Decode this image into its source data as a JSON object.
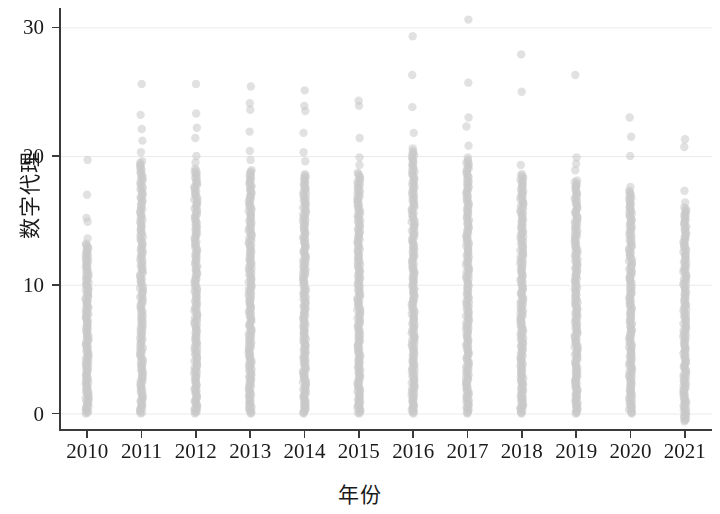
{
  "chart_data": {
    "type": "scatter",
    "title": "",
    "xlabel": "年份",
    "ylabel": "数字代理",
    "grid": true,
    "grid_axis": "y",
    "legend": "none",
    "point_color": "#c9c9c9",
    "point_opacity": 0.55,
    "point_radius": 4.2,
    "axis_color": "#3a3a3a",
    "background": "#ffffff",
    "xlim": [
      2009.5,
      2021.5
    ],
    "ylim": [
      -1.2,
      31.5
    ],
    "ytick_values": [
      0,
      10,
      20,
      30
    ],
    "ytick_labels": [
      "0",
      "10",
      "20",
      "30"
    ],
    "categories": [
      2010,
      2011,
      2012,
      2013,
      2014,
      2015,
      2016,
      2017,
      2018,
      2019,
      2020,
      2021
    ],
    "xtick_labels": [
      "2010",
      "2011",
      "2012",
      "2013",
      "2014",
      "2015",
      "2016",
      "2017",
      "2018",
      "2019",
      "2020",
      "2021"
    ],
    "columns": [
      {
        "year": 2010,
        "max": 19.7,
        "dense_top": 13.2,
        "dense_bottom": 0.0,
        "dense_count": 150,
        "outliers": [
          19.7,
          17.0,
          15.2,
          14.9,
          13.6
        ]
      },
      {
        "year": 2011,
        "max": 25.6,
        "dense_top": 19.6,
        "dense_bottom": 0.0,
        "dense_count": 175,
        "outliers": [
          25.6,
          23.2,
          22.1,
          21.2,
          20.3
        ]
      },
      {
        "year": 2012,
        "max": 25.6,
        "dense_top": 19.0,
        "dense_bottom": 0.0,
        "dense_count": 180,
        "outliers": [
          25.6,
          23.3,
          22.2,
          21.4,
          20.0,
          19.5
        ]
      },
      {
        "year": 2013,
        "max": 25.4,
        "dense_top": 18.9,
        "dense_bottom": 0.0,
        "dense_count": 185,
        "outliers": [
          25.4,
          24.1,
          23.6,
          21.9,
          20.4,
          19.7
        ]
      },
      {
        "year": 2014,
        "max": 25.1,
        "dense_top": 18.6,
        "dense_bottom": 0.0,
        "dense_count": 185,
        "outliers": [
          25.1,
          23.9,
          23.5,
          21.8,
          20.3,
          19.6
        ]
      },
      {
        "year": 2015,
        "max": 24.3,
        "dense_top": 18.7,
        "dense_bottom": 0.0,
        "dense_count": 185,
        "outliers": [
          24.3,
          23.9,
          21.4,
          19.9,
          19.3
        ]
      },
      {
        "year": 2016,
        "max": 29.3,
        "dense_top": 20.4,
        "dense_bottom": 0.0,
        "dense_count": 190,
        "outliers": [
          29.3,
          26.3,
          23.8,
          21.8,
          20.6
        ]
      },
      {
        "year": 2017,
        "max": 30.6,
        "dense_top": 19.7,
        "dense_bottom": 0.0,
        "dense_count": 190,
        "outliers": [
          30.6,
          25.7,
          23.0,
          22.3,
          20.8,
          19.9
        ]
      },
      {
        "year": 2018,
        "max": 27.9,
        "dense_top": 18.6,
        "dense_bottom": 0.0,
        "dense_count": 185,
        "outliers": [
          27.9,
          25.0,
          19.3
        ]
      },
      {
        "year": 2019,
        "max": 26.3,
        "dense_top": 18.1,
        "dense_bottom": 0.0,
        "dense_count": 180,
        "outliers": [
          26.3,
          19.9,
          19.4,
          18.9
        ]
      },
      {
        "year": 2020,
        "max": 23.0,
        "dense_top": 17.3,
        "dense_bottom": 0.0,
        "dense_count": 170,
        "outliers": [
          23.0,
          21.5,
          20.0,
          17.6
        ]
      },
      {
        "year": 2021,
        "max": 21.3,
        "dense_top": 16.0,
        "dense_bottom": -0.6,
        "dense_count": 160,
        "outliers": [
          21.3,
          20.7,
          17.3,
          16.4
        ]
      }
    ]
  }
}
